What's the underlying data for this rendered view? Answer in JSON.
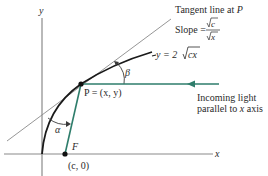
{
  "diagram": {
    "colors": {
      "axis": "#8a8a8a",
      "curve": "#1a1a1a",
      "tangent": "#8a8a8a",
      "light_ray": "#2e7d6b",
      "point": "#111111",
      "text": "#2a2a2a"
    },
    "axes": {
      "x_label": "x",
      "y_label": "y"
    },
    "curve": {
      "equation_lhs": "y = 2",
      "equation_radicand": "cx"
    },
    "tangent": {
      "caption": "Tangent line at ",
      "caption_point": "P",
      "slope_label": "Slope = ",
      "slope_numerator": "c",
      "slope_denominator": "x"
    },
    "point_p": {
      "label": "P = (x, y)"
    },
    "focus": {
      "letter": "F",
      "coords": "(c, 0)"
    },
    "angles": {
      "alpha": "α",
      "beta": "β"
    },
    "light": {
      "line1": "Incoming light",
      "line2_prefix": "parallel to ",
      "line2_var": "x",
      "line2_suffix": " axis"
    }
  }
}
